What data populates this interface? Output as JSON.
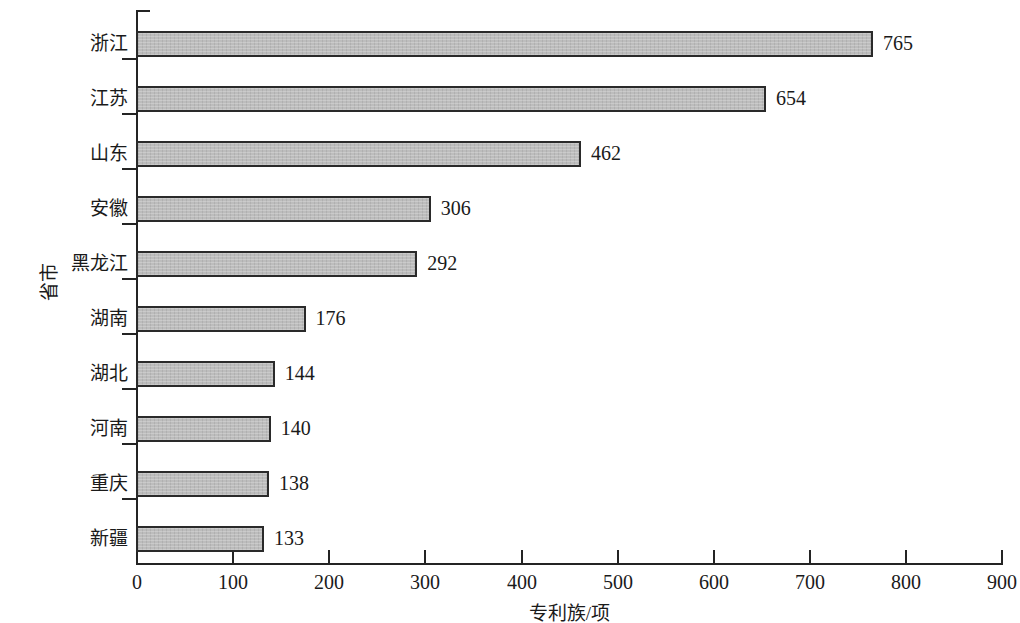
{
  "chart_data": {
    "type": "bar",
    "orientation": "horizontal",
    "title": "",
    "xlabel": "专利族/项",
    "ylabel": "省市",
    "categories": [
      "浙江",
      "江苏",
      "山东",
      "安徽",
      "黑龙江",
      "湖南",
      "湖北",
      "河南",
      "重庆",
      "新疆"
    ],
    "values": [
      765,
      654,
      462,
      306,
      292,
      176,
      144,
      140,
      138,
      133
    ],
    "value_labels": [
      "765",
      "654",
      "462",
      "306",
      "292",
      "176",
      "144",
      "140",
      "138",
      "133"
    ],
    "xlim": [
      0,
      900
    ],
    "xticks": [
      0,
      100,
      200,
      300,
      400,
      500,
      600,
      700,
      800,
      900
    ],
    "xtick_labels": [
      "0",
      "100",
      "200",
      "300",
      "400",
      "500",
      "600",
      "700",
      "800",
      "900"
    ],
    "grid": false,
    "legend": null,
    "bar_fill_color": "#b9b9b9",
    "bar_edge_color": "#2a2a2a",
    "axis_color": "#242424",
    "background_color": "#ffffff"
  }
}
